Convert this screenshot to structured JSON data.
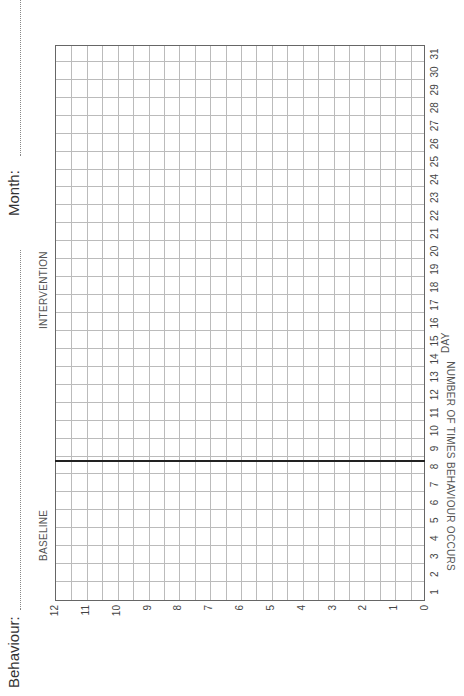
{
  "header": {
    "behaviour_label": "Behaviour:",
    "month_label": "Month:"
  },
  "phases": {
    "baseline": "BASELINE",
    "intervention": "INTERVENTION"
  },
  "chart_data": {
    "type": "line",
    "title": "",
    "xlabel": "DAY",
    "ylabel": "NUMBER OF TIMES BEHAVIOUR OCCURS",
    "x_ticks": [
      1,
      2,
      3,
      4,
      5,
      6,
      7,
      8,
      9,
      10,
      11,
      12,
      13,
      14,
      15,
      16,
      17,
      18,
      19,
      20,
      21,
      22,
      23,
      24,
      25,
      26,
      27,
      28,
      29,
      30,
      31
    ],
    "y_ticks": [
      0,
      1,
      2,
      3,
      4,
      5,
      6,
      7,
      8,
      9,
      10,
      11,
      12
    ],
    "xlim": [
      1,
      31
    ],
    "ylim": [
      0,
      12
    ],
    "grid": true,
    "phase_change_after_day": 8,
    "phase_labels": [
      "BASELINE",
      "INTERVENTION"
    ],
    "series": [],
    "orientation": "rotated 90° counter-clockwise (landscape page)"
  },
  "colors": {
    "grid": "#bbbbbb",
    "border": "#666666",
    "phase_line": "#222222",
    "text": "#333333"
  }
}
